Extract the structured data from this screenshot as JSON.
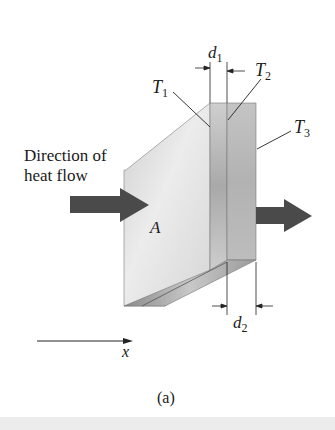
{
  "figure": {
    "caption": "(a)",
    "direction_label_line1": "Direction of",
    "direction_label_line2": "heat flow",
    "area_label": "A",
    "axis_label": "x",
    "labels": {
      "T1": {
        "main": "T",
        "sub": "1"
      },
      "T2": {
        "main": "T",
        "sub": "2"
      },
      "T3": {
        "main": "T",
        "sub": "3"
      },
      "d1": {
        "main": "d",
        "sub": "1"
      },
      "d2": {
        "main": "d",
        "sub": "2"
      }
    },
    "colors": {
      "arrow": "#4a4a4a",
      "slab_face": "#d9d9d9",
      "slab_side": "#bdbdbd",
      "line": "#222222",
      "bottom_band": "#ececec"
    }
  }
}
